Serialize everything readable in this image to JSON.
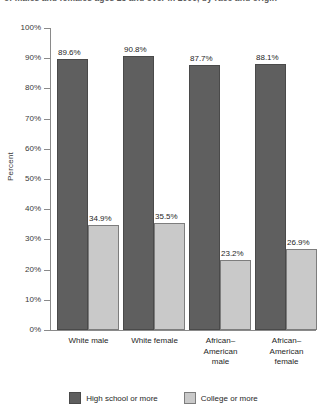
{
  "caption": {
    "text": "of males and females ages 25 and over in 2000, by race and origin"
  },
  "chart_data": {
    "type": "bar",
    "title": "",
    "xlabel": "",
    "ylabel": "Percent",
    "ylim": [
      0,
      100
    ],
    "ytick_labels": [
      "100%",
      "90%",
      "80%",
      "70%",
      "60%",
      "50%",
      "40%",
      "30%",
      "20%",
      "10%",
      "0%"
    ],
    "ytick_values": [
      100,
      90,
      80,
      70,
      60,
      50,
      40,
      30,
      20,
      10,
      0
    ],
    "grid": false,
    "legend_position": "bottom",
    "categories": [
      "White male",
      "White female",
      "African–American male",
      "African–American female"
    ],
    "category_lines": [
      [
        "White male"
      ],
      [
        "White female"
      ],
      [
        "African–",
        "American",
        "male"
      ],
      [
        "African–",
        "American",
        "female"
      ]
    ],
    "series": [
      {
        "name": "High school or more",
        "color": "#5f5f5f",
        "values": [
          89.6,
          90.8,
          87.7,
          88.1
        ],
        "labels": [
          "89.6%",
          "90.8%",
          "87.7%",
          "88.1%"
        ]
      },
      {
        "name": "College or more",
        "color": "#c9c9c9",
        "values": [
          34.9,
          35.5,
          23.2,
          26.9
        ],
        "labels": [
          "34.9%",
          "35.5%",
          "23.2%",
          "26.9%"
        ]
      }
    ]
  }
}
